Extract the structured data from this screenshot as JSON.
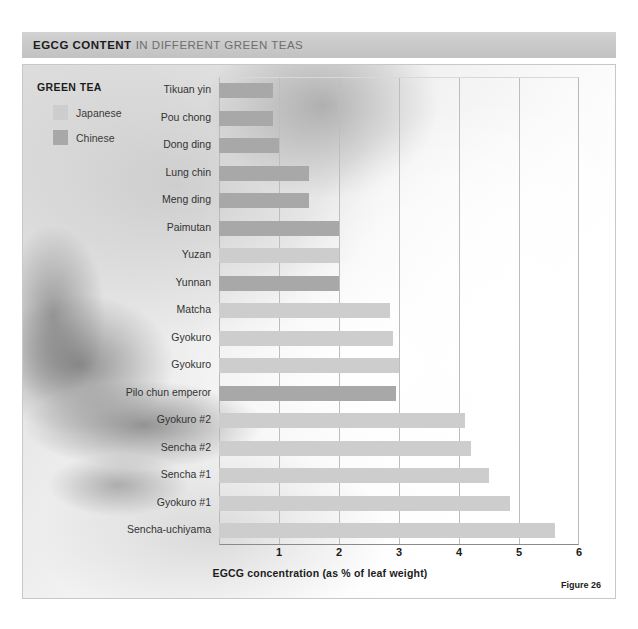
{
  "header": {
    "title_strong": "EGCG CONTENT",
    "title_rest": "IN DIFFERENT GREEN TEAS"
  },
  "legend": {
    "title": "GREEN TEA",
    "items": [
      {
        "label": "Japanese",
        "color": "#cdcdcd"
      },
      {
        "label": "Chinese",
        "color": "#a8a8a8"
      }
    ]
  },
  "figure": {
    "caption": "Figure 26"
  },
  "chart_data": {
    "type": "bar",
    "orientation": "horizontal",
    "title": "EGCG CONTENT IN DIFFERENT GREEN TEAS",
    "xlabel": "EGCG concentration (as % of leaf weight)",
    "ylabel": "",
    "xlim": [
      0,
      6
    ],
    "xticks": [
      1,
      2,
      3,
      4,
      5,
      6
    ],
    "grid": true,
    "legend_position": "top-left",
    "series_names": [
      "Japanese",
      "Chinese"
    ],
    "series_colors": {
      "Japanese": "#cdcdcd",
      "Chinese": "#a8a8a8"
    },
    "categories": [
      "Tikuan yin",
      "Pou chong",
      "Dong ding",
      "Lung chin",
      "Meng ding",
      "Paimutan",
      "Yuzan",
      "Yunnan",
      "Matcha",
      "Gyokuro",
      "Gyokuro",
      "Pilo chun emperor",
      "Gyokuro #2",
      "Sencha #2",
      "Sencha #1",
      "Gyokuro #1",
      "Sencha-uchiyama"
    ],
    "values": [
      0.9,
      0.9,
      1.0,
      1.5,
      1.5,
      2.0,
      2.0,
      2.0,
      2.85,
      2.9,
      3.0,
      2.95,
      4.1,
      4.2,
      4.5,
      4.85,
      5.6
    ],
    "origins": [
      "Chinese",
      "Chinese",
      "Chinese",
      "Chinese",
      "Chinese",
      "Chinese",
      "Japanese",
      "Chinese",
      "Japanese",
      "Japanese",
      "Japanese",
      "Chinese",
      "Japanese",
      "Japanese",
      "Japanese",
      "Japanese",
      "Japanese"
    ]
  }
}
